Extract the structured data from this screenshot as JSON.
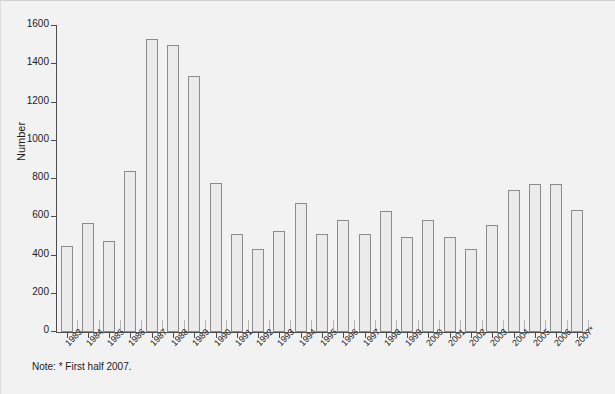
{
  "chart_data": {
    "type": "bar",
    "title": "",
    "xlabel": "",
    "ylabel": "Number",
    "ylim": [
      0,
      1600
    ],
    "yticks": [
      0,
      200,
      400,
      600,
      800,
      1000,
      1200,
      1400,
      1600
    ],
    "grid": false,
    "legend": null,
    "categories": [
      "1983",
      "1984",
      "1985",
      "1986",
      "1987",
      "1988",
      "1989",
      "1990",
      "1991",
      "1992",
      "1993",
      "1994",
      "1995",
      "1996",
      "1997",
      "1998",
      "1999",
      "2000",
      "2001",
      "2002",
      "2003",
      "2004",
      "2005",
      "2006",
      "2007*"
    ],
    "values": [
      450,
      570,
      475,
      840,
      1530,
      1500,
      1340,
      780,
      510,
      435,
      530,
      675,
      510,
      585,
      510,
      635,
      495,
      585,
      495,
      435,
      560,
      740,
      775,
      775,
      640
    ],
    "annotations": [
      "Note: * First half 2007."
    ]
  },
  "figure": {
    "note": "Note: * First half 2007.",
    "bar_fill": "#ebebeb",
    "bar_edge": "#8c8c8c",
    "axis_color": "#4d4d4d",
    "background": "#f2f2f2"
  }
}
